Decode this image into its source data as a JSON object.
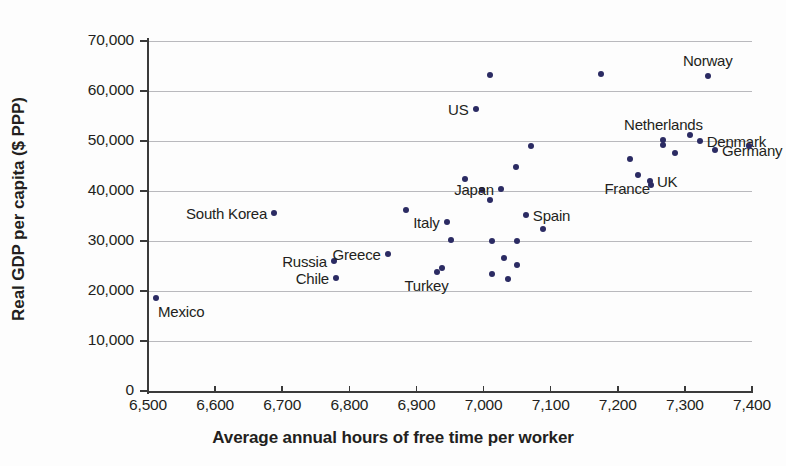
{
  "chart_data": {
    "type": "scatter",
    "title": "",
    "xlabel": "Average annual hours of free time per worker",
    "ylabel": "Real GDP per capita ($ PPP)",
    "xlim": [
      6500,
      7400
    ],
    "ylim": [
      0,
      70000
    ],
    "xticks": [
      "6,500",
      "6,600",
      "6,700",
      "6,800",
      "6,900",
      "7,000",
      "7,100",
      "7,200",
      "7,300",
      "7,400"
    ],
    "xtick_values": [
      6500,
      6600,
      6700,
      6800,
      6900,
      7000,
      7100,
      7200,
      7300,
      7400
    ],
    "yticks": [
      "0",
      "10,000",
      "20,000",
      "30,000",
      "40,000",
      "50,000",
      "60,000",
      "70,000"
    ],
    "ytick_values": [
      0,
      10000,
      20000,
      30000,
      40000,
      50000,
      60000,
      70000
    ],
    "grid": "horizontal",
    "legend": "none",
    "marker_color": "#2b2b63",
    "axis_color": "#3a3a3a",
    "grid_color": "#b9b9bd",
    "text_color": "#231f20",
    "points": [
      {
        "label": "Mexico",
        "x": 6512,
        "y": 18700,
        "label_pos": "below-right"
      },
      {
        "label": "South Korea",
        "x": 6688,
        "y": 35600,
        "label_pos": "left"
      },
      {
        "label": "Chile",
        "x": 6780,
        "y": 22700,
        "label_pos": "left"
      },
      {
        "label": "Russia",
        "x": 6777,
        "y": 26000,
        "label_pos": "left"
      },
      {
        "label": "Greece",
        "x": 6857,
        "y": 27400,
        "label_pos": "left"
      },
      {
        "label": "",
        "x": 6885,
        "y": 36200,
        "label_pos": "none"
      },
      {
        "label": "Turkey",
        "x": 6930,
        "y": 23900,
        "label_pos": "below-left"
      },
      {
        "label": "",
        "x": 6938,
        "y": 24600,
        "label_pos": "none"
      },
      {
        "label": "Italy",
        "x": 6945,
        "y": 33800,
        "label_pos": "left"
      },
      {
        "label": "",
        "x": 6952,
        "y": 30200,
        "label_pos": "none"
      },
      {
        "label": "",
        "x": 6972,
        "y": 42500,
        "label_pos": "none"
      },
      {
        "label": "US",
        "x": 6988,
        "y": 56500,
        "label_pos": "left"
      },
      {
        "label": "",
        "x": 6997,
        "y": 40200,
        "label_pos": "none"
      },
      {
        "label": "",
        "x": 7010,
        "y": 63300,
        "label_pos": "none"
      },
      {
        "label": "",
        "x": 7009,
        "y": 38200,
        "label_pos": "none"
      },
      {
        "label": "",
        "x": 7013,
        "y": 30100,
        "label_pos": "none"
      },
      {
        "label": "",
        "x": 7013,
        "y": 23400,
        "label_pos": "none"
      },
      {
        "label": "Japan",
        "x": 7026,
        "y": 40400,
        "label_pos": "left"
      },
      {
        "label": "",
        "x": 7030,
        "y": 26700,
        "label_pos": "none"
      },
      {
        "label": "",
        "x": 7037,
        "y": 22500,
        "label_pos": "none"
      },
      {
        "label": "",
        "x": 7048,
        "y": 44900,
        "label_pos": "none"
      },
      {
        "label": "",
        "x": 7050,
        "y": 30100,
        "label_pos": "none"
      },
      {
        "label": "",
        "x": 7050,
        "y": 25200,
        "label_pos": "none"
      },
      {
        "label": "Spain",
        "x": 7063,
        "y": 35200,
        "label_pos": "right"
      },
      {
        "label": "",
        "x": 7070,
        "y": 49100,
        "label_pos": "none"
      },
      {
        "label": "",
        "x": 7088,
        "y": 32500,
        "label_pos": "none"
      },
      {
        "label": "",
        "x": 7175,
        "y": 63400,
        "label_pos": "none"
      },
      {
        "label": "",
        "x": 7218,
        "y": 46500,
        "label_pos": "none"
      },
      {
        "label": "France",
        "x": 7230,
        "y": 43200,
        "label_pos": "below-left"
      },
      {
        "label": "UK",
        "x": 7248,
        "y": 42000,
        "label_pos": "right"
      },
      {
        "label": "",
        "x": 7249,
        "y": 41200,
        "label_pos": "none"
      },
      {
        "label": "Netherlands",
        "x": 7268,
        "y": 50300,
        "label_pos": "above"
      },
      {
        "label": "",
        "x": 7268,
        "y": 49200,
        "label_pos": "none"
      },
      {
        "label": "",
        "x": 7285,
        "y": 47700,
        "label_pos": "none"
      },
      {
        "label": "",
        "x": 7308,
        "y": 51300,
        "label_pos": "none"
      },
      {
        "label": "Norway",
        "x": 7334,
        "y": 63000,
        "label_pos": "above"
      },
      {
        "label": "Denmark",
        "x": 7322,
        "y": 50100,
        "label_pos": "right"
      },
      {
        "label": "Germany",
        "x": 7345,
        "y": 48200,
        "label_pos": "right"
      },
      {
        "label": "",
        "x": 7395,
        "y": 49100,
        "label_pos": "none"
      }
    ]
  }
}
